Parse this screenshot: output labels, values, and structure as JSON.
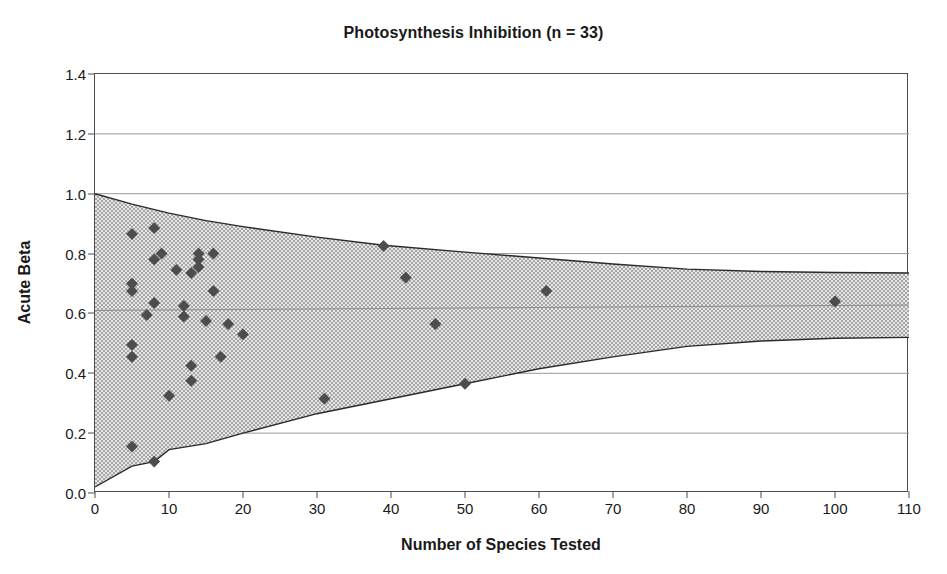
{
  "chart_data": {
    "type": "scatter",
    "title": "Photosynthesis Inhibition (n = 33)",
    "xlabel": "Number of Species Tested",
    "ylabel": "Acute Beta",
    "xlim": [
      0,
      110
    ],
    "ylim": [
      0.0,
      1.4
    ],
    "xticks": [
      0,
      10,
      20,
      30,
      40,
      50,
      60,
      70,
      80,
      90,
      100,
      110
    ],
    "xtick_labels": [
      "0",
      "10",
      "20",
      "30",
      "40",
      "50",
      "60",
      "70",
      "80",
      "90",
      "100",
      "110"
    ],
    "yticks": [
      0.0,
      0.2,
      0.4,
      0.6,
      0.8,
      1.0,
      1.2,
      1.4
    ],
    "ytick_labels": [
      "0.0",
      "0.2",
      "0.4",
      "0.6",
      "0.8",
      "1.0",
      "1.2",
      "1.4"
    ],
    "grid": "horizontal",
    "legend": "none",
    "n": 33,
    "marker": "diamond",
    "marker_color": "#4d4d4d",
    "points": [
      {
        "x": 5,
        "y": 0.865
      },
      {
        "x": 5,
        "y": 0.7
      },
      {
        "x": 5,
        "y": 0.675
      },
      {
        "x": 5,
        "y": 0.455
      },
      {
        "x": 5,
        "y": 0.495
      },
      {
        "x": 5,
        "y": 0.155
      },
      {
        "x": 7,
        "y": 0.595
      },
      {
        "x": 8,
        "y": 0.885
      },
      {
        "x": 8,
        "y": 0.78
      },
      {
        "x": 8,
        "y": 0.635
      },
      {
        "x": 8,
        "y": 0.105
      },
      {
        "x": 9,
        "y": 0.8
      },
      {
        "x": 10,
        "y": 0.325
      },
      {
        "x": 11,
        "y": 0.745
      },
      {
        "x": 12,
        "y": 0.59
      },
      {
        "x": 12,
        "y": 0.625
      },
      {
        "x": 13,
        "y": 0.735
      },
      {
        "x": 13,
        "y": 0.425
      },
      {
        "x": 13,
        "y": 0.375
      },
      {
        "x": 14,
        "y": 0.78
      },
      {
        "x": 14,
        "y": 0.755
      },
      {
        "x": 14,
        "y": 0.8
      },
      {
        "x": 15,
        "y": 0.575
      },
      {
        "x": 16,
        "y": 0.8
      },
      {
        "x": 16,
        "y": 0.675
      },
      {
        "x": 17,
        "y": 0.455
      },
      {
        "x": 18,
        "y": 0.565
      },
      {
        "x": 20,
        "y": 0.53
      },
      {
        "x": 31,
        "y": 0.315
      },
      {
        "x": 39,
        "y": 0.825
      },
      {
        "x": 42,
        "y": 0.72
      },
      {
        "x": 46,
        "y": 0.565
      },
      {
        "x": 50,
        "y": 0.365
      },
      {
        "x": 61,
        "y": 0.675
      },
      {
        "x": 100,
        "y": 0.64
      }
    ],
    "funnel": {
      "description": "Shaded confidence funnel narrowing with sample size",
      "fill_color": "#d9d9d9",
      "edge_color": "#2b2b2b",
      "upper": [
        {
          "x": 0,
          "y": 1.0
        },
        {
          "x": 5,
          "y": 0.965
        },
        {
          "x": 10,
          "y": 0.935
        },
        {
          "x": 15,
          "y": 0.91
        },
        {
          "x": 20,
          "y": 0.89
        },
        {
          "x": 30,
          "y": 0.855
        },
        {
          "x": 39,
          "y": 0.828
        },
        {
          "x": 50,
          "y": 0.805
        },
        {
          "x": 60,
          "y": 0.785
        },
        {
          "x": 70,
          "y": 0.765
        },
        {
          "x": 80,
          "y": 0.748
        },
        {
          "x": 90,
          "y": 0.74
        },
        {
          "x": 100,
          "y": 0.737
        },
        {
          "x": 110,
          "y": 0.735
        }
      ],
      "lower": [
        {
          "x": 0,
          "y": 0.02
        },
        {
          "x": 5,
          "y": 0.09
        },
        {
          "x": 8,
          "y": 0.105
        },
        {
          "x": 10,
          "y": 0.145
        },
        {
          "x": 15,
          "y": 0.165
        },
        {
          "x": 20,
          "y": 0.2
        },
        {
          "x": 30,
          "y": 0.265
        },
        {
          "x": 40,
          "y": 0.315
        },
        {
          "x": 50,
          "y": 0.365
        },
        {
          "x": 60,
          "y": 0.415
        },
        {
          "x": 70,
          "y": 0.455
        },
        {
          "x": 80,
          "y": 0.49
        },
        {
          "x": 90,
          "y": 0.508
        },
        {
          "x": 100,
          "y": 0.517
        },
        {
          "x": 110,
          "y": 0.52
        }
      ],
      "center": [
        {
          "x": 0,
          "y": 0.61
        },
        {
          "x": 110,
          "y": 0.628
        }
      ]
    }
  }
}
